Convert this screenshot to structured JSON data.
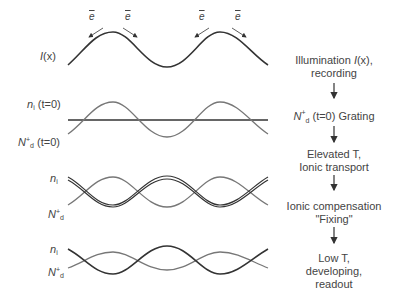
{
  "panels": [
    {
      "id": "illumination",
      "labels": [
        "I(x)"
      ]
    },
    {
      "id": "initial",
      "labels": [
        "n_i (t=0)",
        "N+_d (t=0)"
      ]
    },
    {
      "id": "transport",
      "labels": [
        "n_i",
        "N+_d"
      ]
    },
    {
      "id": "developed",
      "labels": [
        "n_i",
        "N+_d"
      ]
    }
  ],
  "electron_label": "e",
  "flow_steps": [
    {
      "line1": "Illumination I(x),",
      "line2": "recording"
    },
    {
      "line1": "N+d (t=0) Grating"
    },
    {
      "line1": "Elevated T,",
      "line2": "Ionic transport"
    },
    {
      "line1": "Ionic compensation",
      "line2": "\"Fixing\""
    },
    {
      "line1": "Low T,",
      "line2": "developing,",
      "line3": "readout"
    }
  ],
  "text": {
    "I_label": "I",
    "x_label": "(x)",
    "n_sym": "n",
    "i_sub": "i",
    "t0": " (t=0)",
    "N_sym": "N",
    "plus": "+",
    "d_sub": "d",
    "step1_a": "Illumination ",
    "step1_I": "I",
    "step1_b": "(x),",
    "step1_c": "recording",
    "step2_N": "N",
    "step2_plus": "+",
    "step2_d": "d",
    "step2_t": " (t=0) Grating",
    "step3_a": "Elevated T,",
    "step3_b": "Ionic transport",
    "step4_a": "Ionic compensation",
    "step4_b": "\"Fixing\"",
    "step5_a": "Low T,",
    "step5_b": "developing,",
    "step5_c": "readout",
    "e": "e"
  }
}
